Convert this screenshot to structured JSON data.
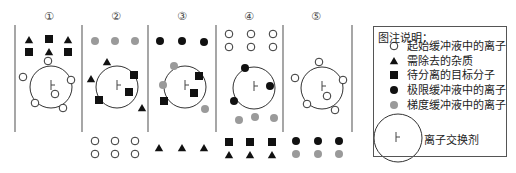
{
  "figure": {
    "panels": [
      {
        "id": 1,
        "label": "①"
      },
      {
        "id": 2,
        "label": "②"
      },
      {
        "id": 3,
        "label": "③"
      },
      {
        "id": 4,
        "label": "④"
      },
      {
        "id": 5,
        "label": "⑤"
      }
    ],
    "legend": {
      "title": "图注说明：",
      "items": [
        {
          "symbol": "open-circle",
          "label": "起始缓冲液中的离子"
        },
        {
          "symbol": "black-triangle",
          "label": "需除去的杂质"
        },
        {
          "symbol": "black-square",
          "label": "待分离的目标分子"
        },
        {
          "symbol": "black-circle",
          "label": "极限缓冲液中的离子"
        },
        {
          "symbol": "gray-circle",
          "label": "梯度缓冲液中的离子"
        }
      ],
      "exchanger_label": "离子交换剂",
      "exchanger_glyph": "⊢"
    },
    "colors": {
      "black": "#111111",
      "gray": "#9a9a9a",
      "line": "#777777",
      "white": "#ffffff"
    }
  }
}
